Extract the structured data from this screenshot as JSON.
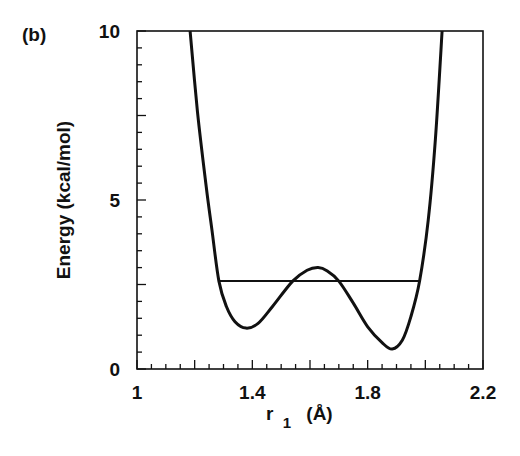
{
  "chart_data": {
    "type": "line",
    "panel_label": "(b)",
    "title": "",
    "xlabel": "r",
    "xlabel_sub": "1",
    "xlabel_unit": "(Å)",
    "ylabel": "Energy  (kcal/mol)",
    "xlim": [
      1.0,
      2.2
    ],
    "ylim": [
      0,
      10
    ],
    "x_major_ticks": [
      1.0,
      1.2,
      1.4,
      1.6,
      1.8,
      2.0,
      2.2
    ],
    "x_tick_labels": [
      {
        "value": 1.0,
        "label": "1"
      },
      {
        "value": 1.4,
        "label": "1.4"
      },
      {
        "value": 1.8,
        "label": "1.8"
      },
      {
        "value": 2.2,
        "label": "2.2"
      }
    ],
    "x_minor_step": 0.05,
    "y_major_ticks": [
      0,
      2.5,
      5,
      7.5,
      10
    ],
    "y_tick_labels": [
      {
        "value": 0,
        "label": "0"
      },
      {
        "value": 5,
        "label": "5"
      },
      {
        "value": 10,
        "label": "10"
      }
    ],
    "y_minor_step": 0.5,
    "grid": false,
    "series": [
      {
        "name": "potential energy curve",
        "x": [
          1.184,
          1.21,
          1.24,
          1.26,
          1.284,
          1.31,
          1.34,
          1.378,
          1.42,
          1.47,
          1.54,
          1.59,
          1.628,
          1.66,
          1.7,
          1.75,
          1.8,
          1.85,
          1.885,
          1.92,
          1.95,
          1.98,
          2.01,
          2.035,
          2.058
        ],
        "y": [
          10.0,
          7.6,
          5.4,
          4.1,
          2.6,
          1.85,
          1.4,
          1.21,
          1.35,
          1.85,
          2.6,
          2.92,
          3.0,
          2.9,
          2.6,
          1.95,
          1.25,
          0.78,
          0.59,
          0.85,
          1.55,
          2.6,
          4.4,
          6.8,
          10.0
        ]
      },
      {
        "name": "energy level",
        "x": [
          1.284,
          1.98
        ],
        "y": [
          2.6,
          2.6
        ]
      }
    ]
  }
}
